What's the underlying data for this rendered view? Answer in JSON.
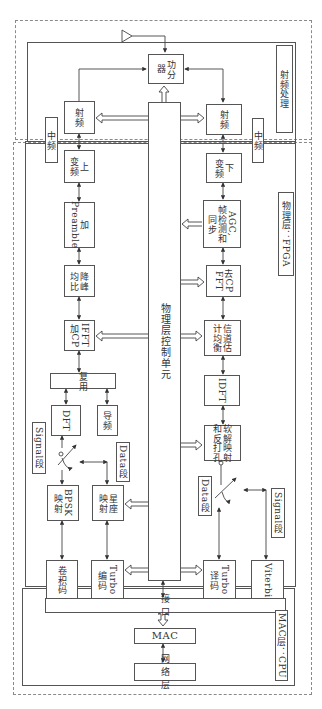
{
  "regions": {
    "rf": {
      "label": "射频处理"
    },
    "phy": {
      "label": "物理层：FPGA"
    },
    "mac": {
      "label": "MAC层：CPU"
    }
  },
  "rf_blocks": {
    "antenna": "antenna",
    "splitter": "功分\n器",
    "rf_tx": "射频",
    "rf_rx": "射频",
    "if_tx": "中频",
    "if_rx": "中频"
  },
  "phy_control": {
    "label": "物理层控制单元"
  },
  "tx_chain": {
    "upconvert": "上\n变频",
    "preamble": "加\nPreamble",
    "papr": "降峰\n均比",
    "ifft": "IFFT\n加CP",
    "mux": "复用",
    "dft": "DFT",
    "pilot": "导频",
    "signal_label": "Signal段",
    "data_label": "Data段",
    "bpsk": "BPSK\n映射",
    "constellation": "星座\n映射",
    "conv_code": "卷积码",
    "turbo_enc": "Turbo\n编码"
  },
  "rx_chain": {
    "downconvert": "下\n变频",
    "agc": "AGC,\n帧检测和\n同步",
    "fft": "去CP\nFFT",
    "chan_est": "信道估\n计均衡",
    "idft": "IDFT",
    "soft_demap": "软解映射\n和反打孔",
    "data_label": "Data段",
    "signal_label": "Signal段",
    "turbo_dec": "Turbo\n译码",
    "viterbi": "Viterbi"
  },
  "mac_blocks": {
    "interface": "接 口",
    "mac": "MAC",
    "network": "网 络 层"
  }
}
